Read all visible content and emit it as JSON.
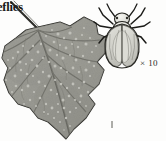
{
  "figure": {
    "caption_fragment": "eflies",
    "magnification_label": "× 10",
    "background_color": "#fdfdfc",
    "ink_color": "#1a1a18"
  },
  "leaf": {
    "name": "infested-leaf",
    "description": "Lobed leaf with whitefly colonies",
    "fill_color": "#9a9a93",
    "outline_color": "#2a2a26",
    "vein_color": "#4a4a44",
    "speckle_color": "#f2f2ec",
    "speckle_count": 96
  },
  "insect": {
    "name": "whitefly-adult",
    "description": "Dorsal view of adult whitefly",
    "wing_color": "#d6d6d0",
    "body_color": "#e8e8e2",
    "leg_color": "#1c1c19",
    "magnification": "× 10"
  },
  "tick_mark": {
    "name": "stray-ink-mark",
    "x": 112,
    "y": 124
  }
}
